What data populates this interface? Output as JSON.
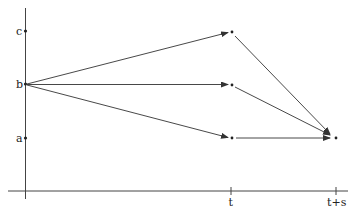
{
  "diagram": {
    "type": "state-transition",
    "y_labels": [
      {
        "label": "c",
        "y": 31
      },
      {
        "label": "b",
        "y": 84
      },
      {
        "label": "a",
        "y": 138
      }
    ],
    "x_labels": [
      {
        "label": "t",
        "x": 231
      },
      {
        "label": "t+s",
        "x": 336
      }
    ],
    "origin": {
      "label": "b"
    },
    "intermediate_states": [
      "c",
      "b",
      "a"
    ],
    "final_state": {
      "label": "a",
      "time": "t+s"
    },
    "colors": {
      "line": "#333333",
      "text": "#222222",
      "background": "#ffffff"
    }
  }
}
